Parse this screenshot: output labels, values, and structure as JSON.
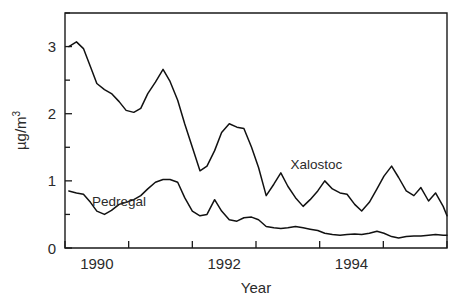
{
  "chart_data": {
    "type": "line",
    "title": "",
    "xlabel": "Year",
    "ylabel": "µg/m3",
    "ylabel_base": "µg/m",
    "ylabel_exponent": "3",
    "xlim": [
      1989.5,
      1995.5
    ],
    "ylim": [
      0,
      3.5
    ],
    "grid": false,
    "legend_position": "inline-annotations",
    "y_ticks_major": [
      0,
      1,
      2,
      3
    ],
    "y_tick_labels": [
      "0",
      "1",
      "2",
      "3"
    ],
    "y_ticks_minor": [
      0.5,
      1.5,
      2.5,
      3.5
    ],
    "x_ticks_major": [
      1989.5,
      1990.5,
      1991.5,
      1992.5,
      1993.5,
      1994.5,
      1995.5
    ],
    "x_tick_labels": [
      "1990",
      "1992",
      "1994"
    ],
    "x_tick_label_positions": [
      1990,
      1992,
      1994
    ],
    "series": [
      {
        "name": "Xalostoc",
        "label_x": 1993.45,
        "label_y": 1.17,
        "x": [
          1989.56,
          1989.68,
          1989.79,
          1989.9,
          1990.0,
          1990.12,
          1990.23,
          1990.35,
          1990.46,
          1990.58,
          1990.69,
          1990.8,
          1990.92,
          1991.04,
          1991.15,
          1991.27,
          1991.38,
          1991.5,
          1991.62,
          1991.73,
          1991.85,
          1991.96,
          1992.08,
          1992.2,
          1992.31,
          1992.43,
          1992.54,
          1992.66,
          1992.78,
          1992.89,
          1993.0,
          1993.12,
          1993.24,
          1993.35,
          1993.47,
          1993.58,
          1993.7,
          1993.82,
          1993.93,
          1994.05,
          1994.16,
          1994.28,
          1994.4,
          1994.51,
          1994.63,
          1994.74,
          1994.86,
          1994.98,
          1995.09,
          1995.21,
          1995.32,
          1995.44
        ],
        "values": [
          3.0,
          3.07,
          2.97,
          2.7,
          2.45,
          2.36,
          2.3,
          2.18,
          2.05,
          2.02,
          2.08,
          2.3,
          2.47,
          2.66,
          2.48,
          2.2,
          1.85,
          1.5,
          1.15,
          1.22,
          1.45,
          1.72,
          1.85,
          1.8,
          1.78,
          1.5,
          1.2,
          0.78,
          0.95,
          1.12,
          0.92,
          0.75,
          0.62,
          0.72,
          0.85,
          1.0,
          0.88,
          0.82,
          0.8,
          0.65,
          0.55,
          0.68,
          0.88,
          1.07,
          1.22,
          1.05,
          0.85,
          0.78,
          0.9,
          0.7,
          0.82,
          0.62
        ],
        "end_value": 0.48
      },
      {
        "name": "Pedregal",
        "label_x": 1990.35,
        "label_y": 0.62,
        "x": [
          1989.56,
          1989.68,
          1989.79,
          1989.9,
          1990.0,
          1990.12,
          1990.23,
          1990.35,
          1990.46,
          1990.58,
          1990.69,
          1990.8,
          1990.92,
          1991.04,
          1991.15,
          1991.27,
          1991.38,
          1991.5,
          1991.62,
          1991.73,
          1991.85,
          1991.96,
          1992.08,
          1992.2,
          1992.31,
          1992.43,
          1992.54,
          1992.66,
          1992.78,
          1992.89,
          1993.0,
          1993.12,
          1993.24,
          1993.35,
          1993.47,
          1993.58,
          1993.7,
          1993.82,
          1993.93,
          1994.05,
          1994.16,
          1994.28,
          1994.4,
          1994.51,
          1994.63,
          1994.74,
          1994.86,
          1994.98,
          1995.09,
          1995.21,
          1995.32,
          1995.44
        ],
        "values": [
          0.85,
          0.82,
          0.8,
          0.68,
          0.55,
          0.5,
          0.56,
          0.65,
          0.68,
          0.72,
          0.78,
          0.88,
          0.98,
          1.02,
          1.02,
          0.98,
          0.75,
          0.55,
          0.48,
          0.5,
          0.72,
          0.55,
          0.42,
          0.4,
          0.45,
          0.46,
          0.42,
          0.32,
          0.3,
          0.29,
          0.3,
          0.32,
          0.3,
          0.28,
          0.26,
          0.22,
          0.2,
          0.19,
          0.2,
          0.21,
          0.2,
          0.22,
          0.25,
          0.22,
          0.17,
          0.15,
          0.17,
          0.18,
          0.18,
          0.19,
          0.2,
          0.19
        ],
        "end_value": 0.19
      }
    ]
  }
}
